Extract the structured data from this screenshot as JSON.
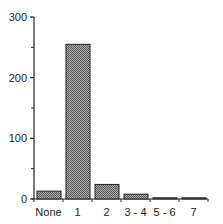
{
  "chart_data": {
    "type": "bar",
    "title": "",
    "xlabel": "",
    "ylabel": "",
    "categories": [
      "None",
      "1",
      "2",
      "3 - 4",
      "5 - 6",
      "7"
    ],
    "values": [
      13,
      255,
      24,
      8,
      2,
      2
    ],
    "ylim": [
      0,
      300
    ],
    "yticks": [
      "0",
      "100",
      "200",
      "300"
    ],
    "minor_yticks": [
      50,
      150,
      250
    ],
    "grid": false,
    "legend": null,
    "bar_fill": "#8a8a8a",
    "bar_stroke": "#222222"
  }
}
